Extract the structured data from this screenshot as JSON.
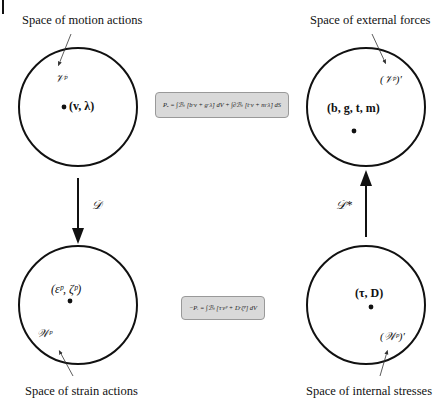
{
  "spaces": {
    "motion": {
      "label": "Space of motion actions",
      "symbol": "𝒱ᵖ",
      "point": "(v, λ)"
    },
    "external": {
      "label": "Space of external forces",
      "symbol": "(𝒱ᵖ)′",
      "point": "(b, g, t, m)"
    },
    "strain": {
      "label": "Space of strain actions",
      "symbol": "𝒲ᵖ",
      "point": "(εᵖ, ζᵖ)"
    },
    "internal": {
      "label": "Space of internal stresses",
      "symbol": "(𝒲ᵖ)′",
      "point": "(τ, D)"
    }
  },
  "operators": {
    "left": "𝒟",
    "right": "𝒟*"
  },
  "equations": {
    "external_power": "Pₑ = ∫ℬₜ [b·v + g·λ̇] dV + ∫∂ℬₜ [t·v + m·λ̇] dS",
    "internal_power": "−Pᵢ = ∫ℬₜ [τ·εᵖ + D·ζ̇ᵖ] dV"
  }
}
